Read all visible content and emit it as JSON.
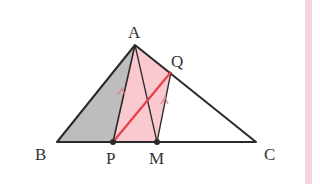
{
  "diagram": {
    "type": "geometry",
    "colors": {
      "stroke": "#2a2a2a",
      "gray_fill": "#bdbdbd",
      "pink_fill": "#f9c9cf",
      "red_line": "#e8404a",
      "parallel_mark": "#e57d85",
      "edge_strip": "#f7d3db"
    },
    "points": {
      "A": {
        "label": "A",
        "x": 135,
        "y": 45
      },
      "B": {
        "label": "B",
        "x": 57,
        "y": 142
      },
      "C": {
        "label": "C",
        "x": 256,
        "y": 142
      },
      "P": {
        "label": "P",
        "x": 113,
        "y": 142
      },
      "M": {
        "label": "M",
        "x": 157,
        "y": 142
      },
      "Q": {
        "label": "Q",
        "x": 171,
        "y": 72
      }
    },
    "segments": [
      {
        "from": "A",
        "to": "B"
      },
      {
        "from": "A",
        "to": "C"
      },
      {
        "from": "B",
        "to": "C"
      },
      {
        "from": "A",
        "to": "P"
      },
      {
        "from": "A",
        "to": "M"
      },
      {
        "from": "Q",
        "to": "M"
      },
      {
        "from": "P",
        "to": "Q",
        "color": "red"
      }
    ],
    "regions": [
      {
        "name": "triangle-ABP",
        "fill": "gray"
      },
      {
        "name": "quadrilateral-APMQ",
        "fill": "pink"
      }
    ],
    "parallel_marks": [
      "A-P",
      "Q-M"
    ]
  }
}
